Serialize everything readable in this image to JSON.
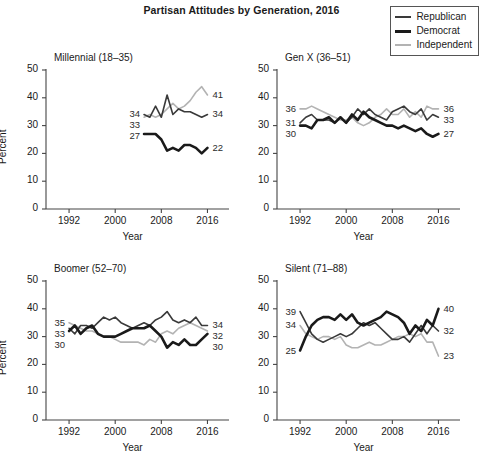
{
  "figure": {
    "title": "Partisan Attitudes by Generation, 2016",
    "xlabel": "Year",
    "ylabel": "Percent"
  },
  "legend": {
    "position": "top-right",
    "items": [
      {
        "label": "Republican",
        "color": "#3a3a3a",
        "width": 1.6
      },
      {
        "label": "Democrat",
        "color": "#1a1a1a",
        "width": 2.6
      },
      {
        "label": "Independent",
        "color": "#b3b3b3",
        "width": 1.6
      }
    ]
  },
  "axes": {
    "y_ticks": [
      "0",
      "10",
      "20",
      "30",
      "40",
      "50"
    ],
    "x_ticks": [
      "1992",
      "2000",
      "2008",
      "2016"
    ],
    "ylim": [
      0,
      50
    ],
    "xlim": [
      1988,
      2018
    ],
    "grid": false
  },
  "chart_data": [
    {
      "type": "line",
      "title": "Millennial (18–35)",
      "xlabel": "Year",
      "ylabel": "Percent",
      "ylim": [
        0,
        50
      ],
      "xlim": [
        1988,
        2018
      ],
      "grid": false,
      "x": [
        2005,
        2006,
        2007,
        2008,
        2009,
        2010,
        2011,
        2012,
        2013,
        2014,
        2015,
        2016
      ],
      "start_labels": [
        {
          "series": "Republican",
          "value": "34"
        },
        {
          "series": "Independent",
          "value": "33"
        },
        {
          "series": "Democrat",
          "value": "27"
        }
      ],
      "end_labels": [
        {
          "series": "Independent",
          "value": "41"
        },
        {
          "series": "Republican",
          "value": "34"
        },
        {
          "series": "Democrat",
          "value": "22"
        }
      ],
      "series": [
        {
          "name": "Republican",
          "color": "#3a3a3a",
          "width": 1.6,
          "values": [
            34,
            33,
            37,
            33,
            41,
            34,
            36,
            35,
            35,
            34,
            33,
            34
          ]
        },
        {
          "name": "Democrat",
          "color": "#1a1a1a",
          "width": 2.6,
          "values": [
            27,
            27,
            27,
            25,
            21,
            22,
            21,
            23,
            23,
            22,
            20,
            22
          ]
        },
        {
          "name": "Independent",
          "color": "#b3b3b3",
          "width": 1.6,
          "values": [
            33,
            34,
            33,
            34,
            36,
            38,
            36,
            37,
            39,
            42,
            44,
            41
          ]
        }
      ]
    },
    {
      "type": "line",
      "title": "Gen X (36–51)",
      "xlabel": "Year",
      "ylabel": "Percent",
      "ylim": [
        0,
        50
      ],
      "xlim": [
        1988,
        2018
      ],
      "grid": false,
      "x": [
        1992,
        1993,
        1994,
        1995,
        1996,
        1997,
        1998,
        1999,
        2000,
        2001,
        2002,
        2003,
        2004,
        2005,
        2006,
        2007,
        2008,
        2009,
        2010,
        2011,
        2012,
        2013,
        2014,
        2015,
        2016
      ],
      "start_labels": [
        {
          "series": "Independent",
          "value": "36"
        },
        {
          "series": "Republican",
          "value": "31"
        },
        {
          "series": "Democrat",
          "value": "30"
        }
      ],
      "end_labels": [
        {
          "series": "Independent",
          "value": "36"
        },
        {
          "series": "Republican",
          "value": "33"
        },
        {
          "series": "Democrat",
          "value": "27"
        }
      ],
      "series": [
        {
          "name": "Republican",
          "color": "#3a3a3a",
          "width": 1.6,
          "values": [
            31,
            33,
            34,
            32,
            32,
            32,
            31,
            33,
            31,
            33,
            36,
            34,
            36,
            34,
            33,
            32,
            35,
            36,
            37,
            35,
            34,
            36,
            32,
            34,
            33
          ]
        },
        {
          "name": "Democrat",
          "color": "#1a1a1a",
          "width": 2.6,
          "values": [
            30,
            30,
            29,
            32,
            32,
            33,
            31,
            33,
            31,
            34,
            32,
            35,
            33,
            32,
            31,
            30,
            30,
            29,
            30,
            29,
            28,
            29,
            27,
            26,
            27
          ]
        },
        {
          "name": "Independent",
          "color": "#b3b3b3",
          "width": 1.6,
          "values": [
            36,
            36,
            37,
            36,
            35,
            34,
            33,
            32,
            32,
            33,
            31,
            30,
            31,
            33,
            34,
            36,
            34,
            34,
            36,
            33,
            35,
            33,
            37,
            36,
            36
          ]
        }
      ]
    },
    {
      "type": "line",
      "title": "Boomer (52–70)",
      "xlabel": "Year",
      "ylabel": "Percent",
      "ylim": [
        0,
        50
      ],
      "xlim": [
        1988,
        2018
      ],
      "grid": false,
      "x": [
        1992,
        1993,
        1994,
        1995,
        1996,
        1997,
        1998,
        1999,
        2000,
        2001,
        2002,
        2003,
        2004,
        2005,
        2006,
        2007,
        2008,
        2009,
        2010,
        2011,
        2012,
        2013,
        2014,
        2015,
        2016
      ],
      "start_labels": [
        {
          "series": "Independent",
          "value": "35"
        },
        {
          "series": "Republican",
          "value": "33"
        },
        {
          "series": "Democrat",
          "value": "30"
        }
      ],
      "end_labels": [
        {
          "series": "Republican",
          "value": "34"
        },
        {
          "series": "Independent",
          "value": "32"
        },
        {
          "series": "Democrat",
          "value": "30"
        }
      ],
      "series": [
        {
          "name": "Republican",
          "color": "#3a3a3a",
          "width": 1.6,
          "values": [
            33,
            31,
            34,
            34,
            33,
            35,
            37,
            36,
            37,
            35,
            34,
            33,
            34,
            35,
            34,
            36,
            37,
            39,
            36,
            35,
            36,
            35,
            37,
            34,
            34
          ]
        },
        {
          "name": "Democrat",
          "color": "#1a1a1a",
          "width": 2.6,
          "values": [
            32,
            34,
            31,
            33,
            34,
            31,
            30,
            30,
            30,
            31,
            32,
            33,
            33,
            33,
            34,
            32,
            30,
            26,
            28,
            27,
            29,
            27,
            27,
            29,
            31
          ]
        },
        {
          "name": "Independent",
          "color": "#b3b3b3",
          "width": 1.6,
          "values": [
            35,
            34,
            33,
            32,
            32,
            31,
            30,
            30,
            29,
            28,
            28,
            28,
            28,
            27,
            29,
            28,
            31,
            32,
            31,
            33,
            34,
            35,
            34,
            33,
            32
          ]
        }
      ]
    },
    {
      "type": "line",
      "title": "Silent (71–88)",
      "xlabel": "Year",
      "ylabel": "Percent",
      "ylim": [
        0,
        50
      ],
      "xlim": [
        1988,
        2018
      ],
      "grid": false,
      "x": [
        1992,
        1993,
        1994,
        1995,
        1996,
        1997,
        1998,
        1999,
        2000,
        2001,
        2002,
        2003,
        2004,
        2005,
        2006,
        2007,
        2008,
        2009,
        2010,
        2011,
        2012,
        2013,
        2014,
        2015,
        2016
      ],
      "start_labels": [
        {
          "series": "Republican",
          "value": "39"
        },
        {
          "series": "Independent",
          "value": "34"
        },
        {
          "series": "Democrat",
          "value": "25"
        }
      ],
      "end_labels": [
        {
          "series": "Democrat",
          "value": "40"
        },
        {
          "series": "Republican",
          "value": "32"
        },
        {
          "series": "Independent",
          "value": "23"
        }
      ],
      "series": [
        {
          "name": "Republican",
          "color": "#3a3a3a",
          "width": 1.6,
          "values": [
            39,
            35,
            31,
            29,
            28,
            29,
            30,
            31,
            30,
            31,
            33,
            35,
            34,
            35,
            33,
            31,
            29,
            29,
            30,
            28,
            31,
            34,
            31,
            34,
            32
          ]
        },
        {
          "name": "Democrat",
          "color": "#1a1a1a",
          "width": 2.6,
          "values": [
            25,
            30,
            34,
            36,
            37,
            37,
            36,
            38,
            36,
            38,
            35,
            34,
            35,
            36,
            37,
            39,
            38,
            37,
            35,
            31,
            34,
            32,
            36,
            34,
            40
          ]
        },
        {
          "name": "Independent",
          "color": "#b3b3b3",
          "width": 1.6,
          "values": [
            34,
            31,
            30,
            29,
            30,
            30,
            29,
            30,
            27,
            26,
            26,
            27,
            28,
            27,
            27,
            28,
            29,
            30,
            30,
            31,
            30,
            31,
            28,
            28,
            23
          ]
        }
      ]
    }
  ]
}
